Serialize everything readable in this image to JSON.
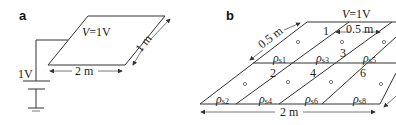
{
  "panel_a": {
    "label": "a",
    "voltage_label_var": "V",
    "voltage_label_val": "=1V",
    "width_dim": "2 m",
    "depth_dim": "1 m",
    "source_label": "1V"
  },
  "panel_b": {
    "label": "b",
    "voltage_label_var": "V",
    "voltage_label_val": "=1V",
    "width_dim": "2 m",
    "strip_dim_left": "0.5 m",
    "strip_dim_top": "0.5 m",
    "region_numbers": [
      "1",
      "2",
      "3",
      "4",
      "6"
    ],
    "rho_symbol": "ρ",
    "top_row_rho_subscripts": [
      "s1",
      "s3",
      "s5"
    ],
    "bottom_row_rho_subscripts": [
      "s2",
      "s4",
      "s6",
      "s8"
    ]
  }
}
